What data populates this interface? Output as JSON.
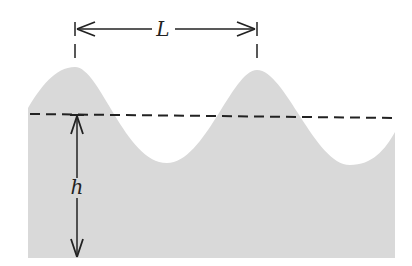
{
  "diagram": {
    "type": "water-wave-cross-section",
    "labels": {
      "wavelength": "L",
      "depth": "h"
    },
    "colors": {
      "water": "#d9d9d9",
      "line": "#222222",
      "background": "#ffffff"
    }
  }
}
